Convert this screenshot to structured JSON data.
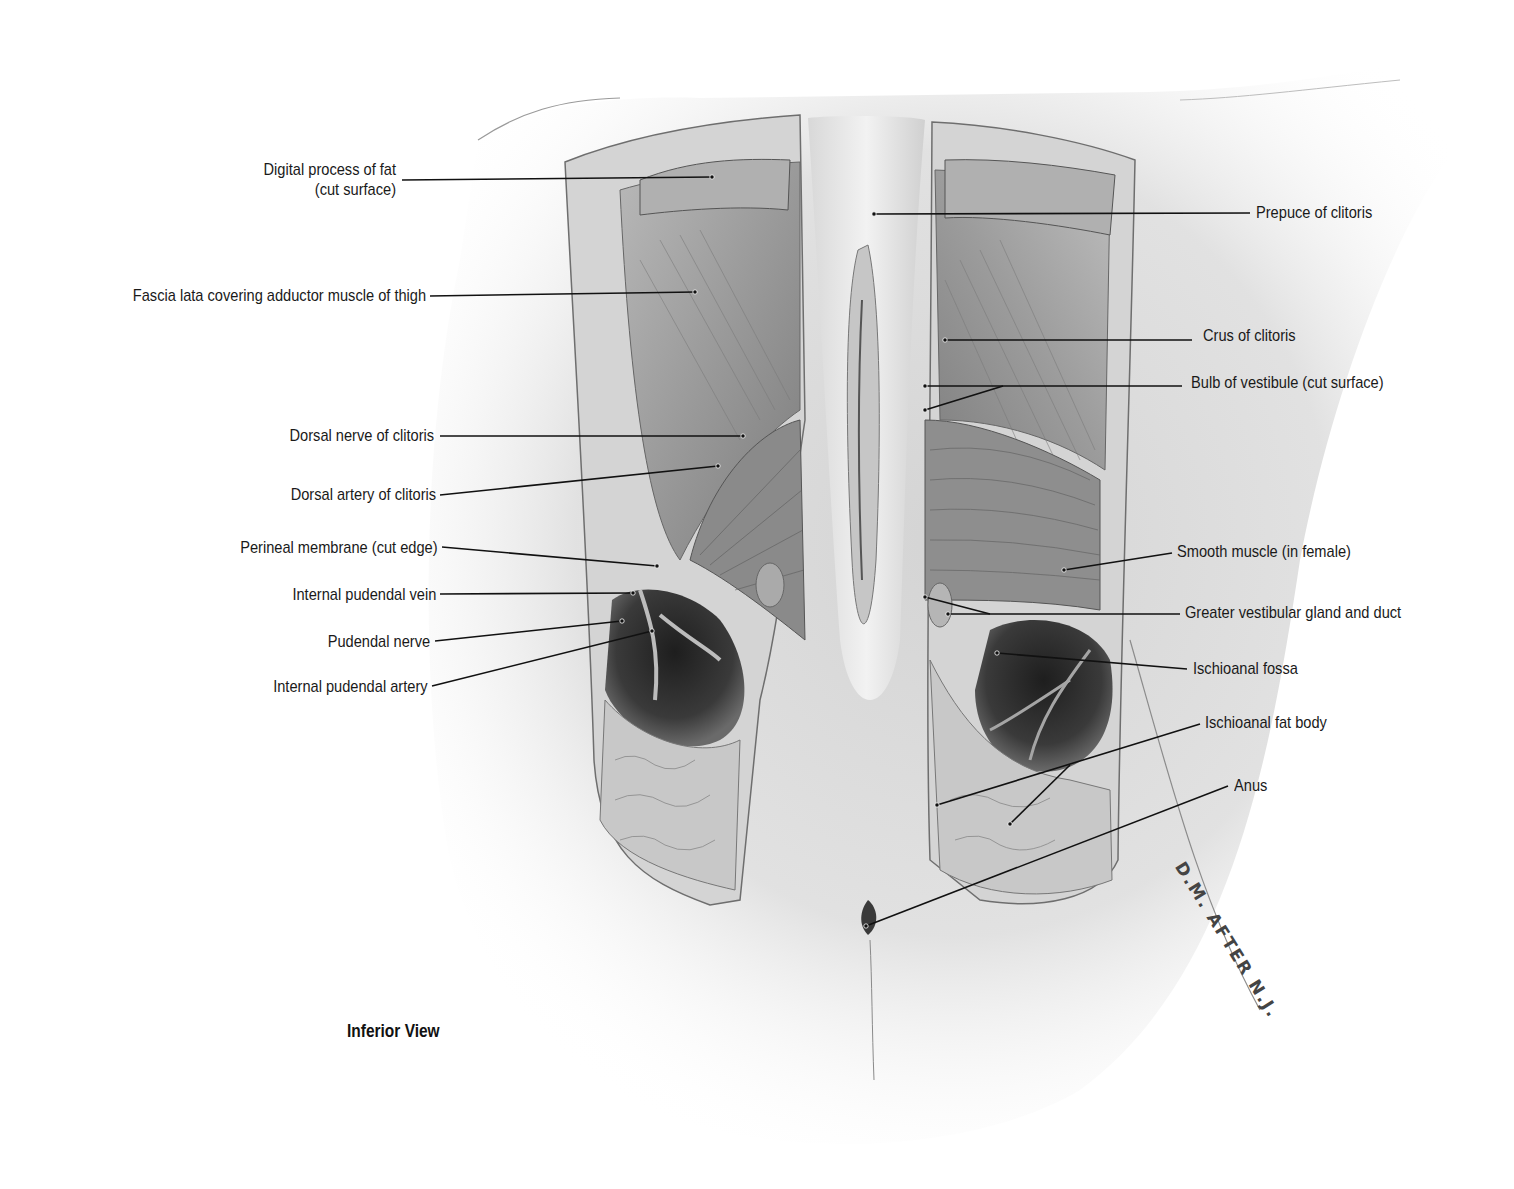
{
  "figure": {
    "view_caption": "Inferior View",
    "signature": "D.M. AFTER N.J.",
    "colors": {
      "ink": "#1a1a1a",
      "leader": "#111111",
      "paper": "#ffffff"
    }
  },
  "labels_left": [
    {
      "id": "digital-process-of-fat",
      "line1": "Digital process of fat",
      "line2": "(cut surface)"
    },
    {
      "id": "fascia-lata",
      "line1": "Fascia lata covering adductor muscle of thigh"
    },
    {
      "id": "dorsal-nerve-of-clitoris",
      "line1": "Dorsal nerve of clitoris"
    },
    {
      "id": "dorsal-artery-of-clitoris",
      "line1": "Dorsal artery of clitoris"
    },
    {
      "id": "perineal-membrane",
      "line1": "Perineal membrane (cut edge)"
    },
    {
      "id": "internal-pudendal-vein",
      "line1": "Internal pudendal vein"
    },
    {
      "id": "pudendal-nerve",
      "line1": "Pudendal nerve"
    },
    {
      "id": "internal-pudendal-artery",
      "line1": "Internal pudendal artery"
    }
  ],
  "labels_right": [
    {
      "id": "prepuce-of-clitoris",
      "line1": "Prepuce of clitoris"
    },
    {
      "id": "crus-of-clitoris",
      "line1": "Crus of clitoris"
    },
    {
      "id": "bulb-of-vestibule",
      "line1": "Bulb of vestibule (cut surface)"
    },
    {
      "id": "smooth-muscle",
      "line1": "Smooth muscle (in female)"
    },
    {
      "id": "greater-vestibular-gland",
      "line1": "Greater vestibular gland and duct"
    },
    {
      "id": "ischioanal-fossa",
      "line1": "Ischioanal fossa"
    },
    {
      "id": "ischioanal-fat-body",
      "line1": "Ischioanal fat body"
    },
    {
      "id": "anus",
      "line1": "Anus"
    }
  ]
}
